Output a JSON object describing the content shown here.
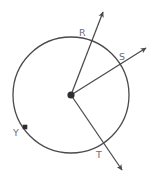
{
  "figure": {
    "canvas": {
      "width": 154,
      "height": 178
    },
    "background_color": "#ffffff",
    "stroke_color": "#4a4a4e",
    "label_color": "#6e6e72"
  },
  "circle": {
    "name": "circle-outline",
    "center_x": 71,
    "center_y": 95,
    "radius": 58,
    "stroke_width": 1.3
  },
  "center_point": {
    "name": "center-point",
    "x": 71,
    "y": 95,
    "radius": 3.6
  },
  "points": [
    {
      "id": "R",
      "label": "R",
      "on_circle_x": 89,
      "on_circle_y": 38,
      "label_x": 79,
      "label_y": 36
    },
    {
      "id": "S",
      "label": "S",
      "on_circle_x": 126,
      "on_circle_y": 62,
      "label_x": 119,
      "label_y": 60
    },
    {
      "id": "T",
      "label": "T",
      "on_circle_x": 103,
      "on_circle_y": 148,
      "label_x": 96,
      "label_y": 158
    },
    {
      "id": "Y",
      "label": "Y",
      "on_circle_x": 25,
      "on_circle_y": 127,
      "label_x": 13,
      "label_y": 136,
      "marker": "square",
      "marker_size": 4.6
    }
  ],
  "rays": [
    {
      "id": "ray-R",
      "label": "R",
      "from_x": 71,
      "from_y": 95,
      "to_x": 103,
      "to_y": 12,
      "arrow": "end"
    },
    {
      "id": "ray-S",
      "label": "S",
      "from_x": 71,
      "from_y": 95,
      "to_x": 146,
      "to_y": 48,
      "arrow": "end"
    },
    {
      "id": "ray-T",
      "label": "T",
      "from_x": 71,
      "from_y": 95,
      "to_x": 122,
      "to_y": 170,
      "arrow": "end"
    }
  ],
  "chart_data": {
    "type": "diagram",
    "labels": [
      "R",
      "S",
      "T",
      "Y"
    ],
    "ray_endpoints_on_circle": [
      "R",
      "S",
      "T"
    ],
    "isolated_points_on_circle": [
      "Y"
    ]
  }
}
